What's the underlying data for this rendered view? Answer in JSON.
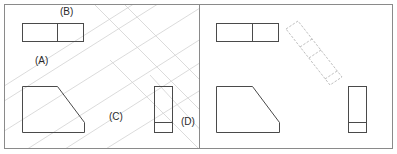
{
  "figure": {
    "panels": [
      {
        "id": "left",
        "description": "projection construction with guide lines",
        "labels": [
          {
            "text": "(B)",
            "x": 60,
            "y": 15
          },
          {
            "text": "(A)",
            "x": 35,
            "y": 64
          },
          {
            "text": "(C)",
            "x": 109,
            "y": 120
          },
          {
            "text": "(D)",
            "x": 181,
            "y": 125
          }
        ]
      },
      {
        "id": "right",
        "description": "result with rotated auxiliary view",
        "labels": []
      }
    ],
    "colors": {
      "outline": "#4a4a4a",
      "border": "#8a8a8a",
      "guide": "#c8c8c8",
      "dashed": "#b0b0b0",
      "background": "#ffffff"
    }
  }
}
